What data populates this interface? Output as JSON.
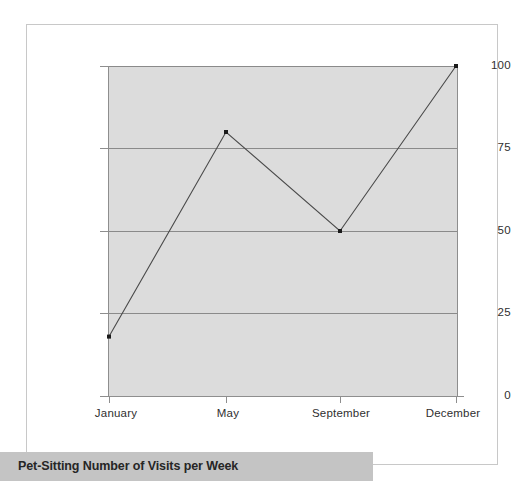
{
  "caption": {
    "text": "Pet-Sitting Number of Visits per Week"
  },
  "chart_data": {
    "type": "line",
    "title": "Pet-Sitting Number of Visits per Week",
    "xlabel": "",
    "ylabel": "",
    "categories": [
      "January",
      "May",
      "September",
      "December"
    ],
    "values": [
      18,
      80,
      50,
      100
    ],
    "series": [
      {
        "name": "Number of Visits per Week",
        "values": [
          18,
          80,
          50,
          100
        ]
      }
    ],
    "x_tick_labels": [
      "January",
      "May",
      "September",
      "December"
    ],
    "y_tick_labels": [
      "100",
      "75",
      "50",
      "25",
      "0"
    ],
    "y_tick_values": [
      100,
      75,
      50,
      25,
      0
    ],
    "ylim": [
      0,
      100
    ],
    "grid": "horizontal",
    "gridlines_at": [
      25,
      50,
      75,
      100
    ],
    "legend": "none",
    "markers": "square",
    "colors": {
      "plot_background": "#dcdcdc",
      "gridline": "#8a8a8a",
      "axis": "#8e8e8e",
      "series_line": "#4a4a4a",
      "marker": "#1a1a1a",
      "tick_label": "#2f2f2f",
      "caption_banner": "#c4c4c4",
      "caption_text": "#262626",
      "page_frame": "#c8c8c8"
    },
    "points": [
      {
        "category": "January",
        "value": 18
      },
      {
        "category": "May",
        "value": 80
      },
      {
        "category": "September",
        "value": 50
      },
      {
        "category": "December",
        "value": 100
      }
    ]
  }
}
